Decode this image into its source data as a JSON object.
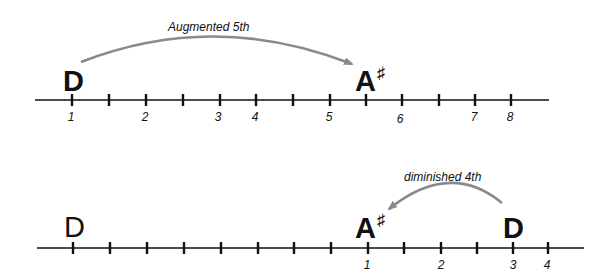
{
  "top": {
    "interval_label": "Augmented 5th",
    "start_note": "D",
    "end_note": "A",
    "end_accidental": "♯",
    "numbers": [
      "1",
      "2",
      "3",
      "4",
      "5",
      "6",
      "7",
      "8"
    ]
  },
  "bottom": {
    "interval_label": "diminished 4th",
    "start_note": "D",
    "end_note": "A",
    "end_accidental": "♯",
    "reference_note": "D",
    "numbers": [
      "1",
      "2",
      "3",
      "4"
    ]
  },
  "colors": {
    "line": "#111111",
    "arrow": "#8a8a8a"
  }
}
